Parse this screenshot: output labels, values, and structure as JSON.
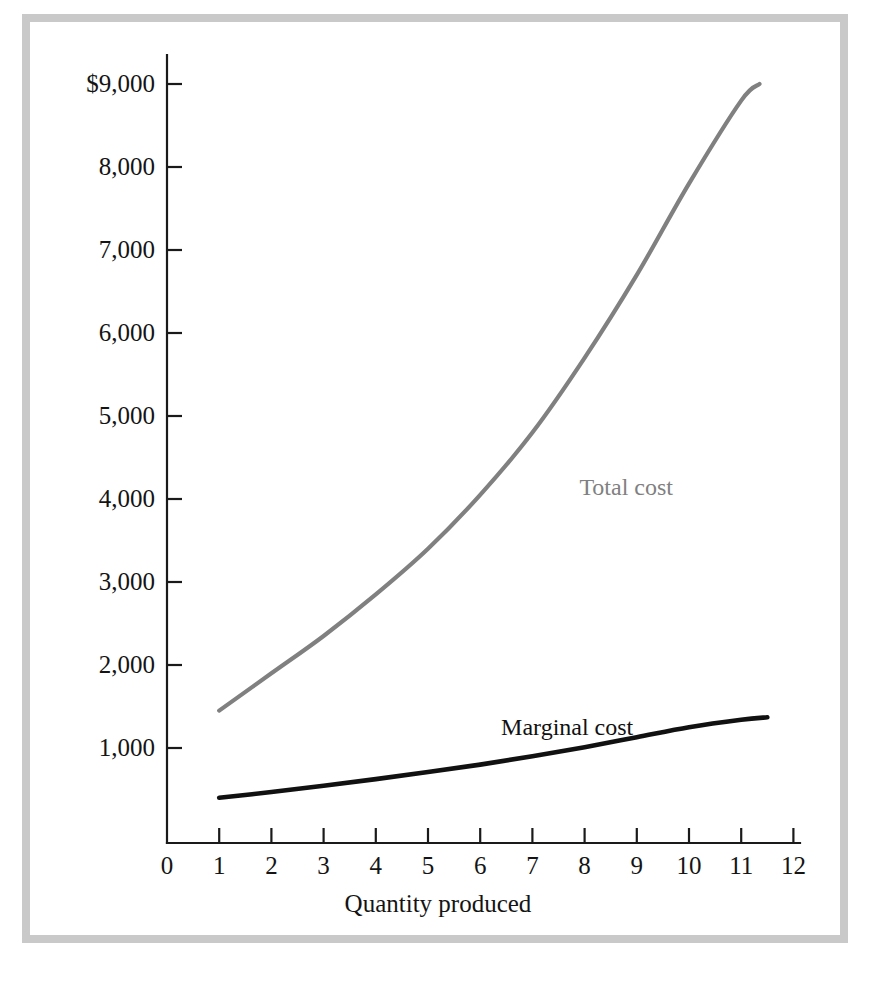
{
  "figure": {
    "frame_color": "#c9c9c9",
    "background": "#ffffff"
  },
  "axes": {
    "x_title": "Quantity produced",
    "y_title": "",
    "x_tick_labels": [
      "0",
      "1",
      "2",
      "3",
      "4",
      "5",
      "6",
      "7",
      "8",
      "9",
      "10",
      "11",
      "12"
    ],
    "y_tick_labels": [
      "1,000",
      "2,000",
      "3,000",
      "4,000",
      "5,000",
      "6,000",
      "7,000",
      "8,000",
      "$9,000"
    ]
  },
  "series_labels": {
    "total": "Total cost",
    "marginal": "Marginal cost"
  },
  "chart_data": {
    "type": "line",
    "title": "",
    "subtitle": "",
    "xlabel": "Quantity produced",
    "ylabel": "",
    "xlim": [
      0,
      12
    ],
    "ylim": [
      0,
      9400
    ],
    "grid": false,
    "legend": "inline-annotations",
    "x_ticks": [
      0,
      1,
      2,
      3,
      4,
      5,
      6,
      7,
      8,
      9,
      10,
      11,
      12
    ],
    "y_ticks": [
      1000,
      2000,
      3000,
      4000,
      5000,
      6000,
      7000,
      8000,
      9000
    ],
    "y_tick_labels": [
      "1,000",
      "2,000",
      "3,000",
      "4,000",
      "5,000",
      "6,000",
      "7,000",
      "8,000",
      "$9,000"
    ],
    "series": [
      {
        "name": "Total cost",
        "color": "#808080",
        "x": [
          1,
          2,
          3,
          4,
          5,
          6,
          7,
          8,
          9,
          10,
          11,
          11.35
        ],
        "values": [
          1450,
          1900,
          2350,
          2850,
          3400,
          4050,
          4800,
          5700,
          6700,
          7800,
          8800,
          9000
        ]
      },
      {
        "name": "Marginal cost",
        "color": "#111111",
        "x": [
          1,
          2,
          3,
          4,
          5,
          6,
          7,
          8,
          9,
          10,
          11,
          11.5
        ],
        "values": [
          400,
          470,
          545,
          625,
          710,
          800,
          900,
          1010,
          1130,
          1250,
          1340,
          1370
        ]
      }
    ],
    "annotations": [
      {
        "text": "Total cost",
        "x": 7.9,
        "y": 4150,
        "color": "#808080"
      },
      {
        "text": "Marginal cost",
        "x": 6.4,
        "y": 1250,
        "color": "#111111"
      }
    ]
  }
}
